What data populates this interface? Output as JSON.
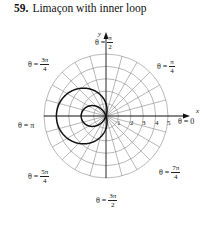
{
  "title": {
    "number": "59.",
    "text": "Limaçon with inner loop"
  },
  "axes": {
    "x_label": "x",
    "y_label": "y"
  },
  "radial_ticks": [
    "1",
    "2",
    "3",
    "4",
    "5"
  ],
  "angle_labels": {
    "theta0": {
      "prefix": "θ = 0"
    },
    "theta_pi4": {
      "prefix": "θ =",
      "num": "π",
      "den": "4"
    },
    "theta_pi2": {
      "prefix": "θ =",
      "num": "π",
      "den": "2"
    },
    "theta_3pi4": {
      "prefix": "θ =",
      "num": "3π",
      "den": "4"
    },
    "theta_pi": {
      "prefix": "θ = π"
    },
    "theta_5pi4": {
      "prefix": "θ =",
      "num": "5π",
      "den": "4"
    },
    "theta_3pi2": {
      "prefix": "θ =",
      "num": "3π",
      "den": "2"
    },
    "theta_7pi4": {
      "prefix": "θ =",
      "num": "7π",
      "den": "4"
    }
  },
  "curve": {
    "equation": "r = 1 - 3cos θ",
    "a": 1,
    "b": 3
  },
  "grid": {
    "max_radius": 5,
    "angle_step_deg": 15,
    "color": "#888888",
    "curve_color": "#111111"
  }
}
